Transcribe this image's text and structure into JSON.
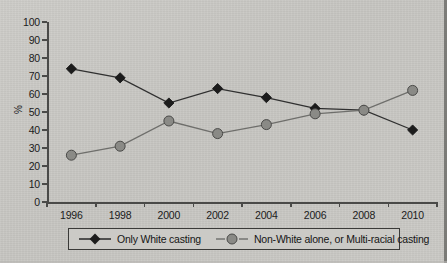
{
  "chart_data": {
    "type": "line",
    "title": "",
    "xlabel": "",
    "ylabel": "%",
    "categories": [
      "1996",
      "1998",
      "2000",
      "2002",
      "2004",
      "2006",
      "2008",
      "2010"
    ],
    "x": [
      1996,
      1998,
      2000,
      2002,
      2004,
      2006,
      2008,
      2010
    ],
    "ylim": [
      0,
      100
    ],
    "yticks": [
      "0",
      "10",
      "20",
      "30",
      "40",
      "50",
      "60",
      "70",
      "80",
      "90",
      "100"
    ],
    "grid": false,
    "legend_position": "bottom",
    "series": [
      {
        "name": "Only White casting",
        "marker": "diamond",
        "color": "#1c1c1c",
        "values": [
          74,
          69,
          55,
          63,
          58,
          52,
          51,
          40
        ]
      },
      {
        "name": "Non-White alone, or Multi-racial casting",
        "marker": "circle",
        "color": "#8a8a86",
        "values": [
          26,
          31,
          45,
          38,
          43,
          49,
          51,
          62
        ]
      }
    ]
  },
  "legend": {
    "items": [
      {
        "label": "Only White casting",
        "icon": "diamond-marker-icon"
      },
      {
        "label": "Non-White alone, or Multi-racial casting",
        "icon": "circle-marker-icon"
      }
    ]
  }
}
